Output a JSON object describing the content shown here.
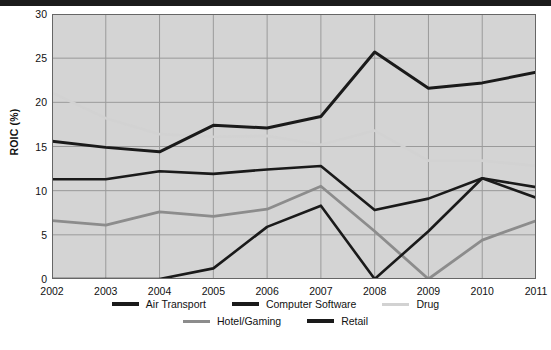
{
  "axis": {
    "ylabel": "ROIC (%)",
    "yticks": [
      0,
      5,
      10,
      15,
      20,
      25,
      30
    ],
    "xticks": [
      "2002",
      "2003",
      "2004",
      "2005",
      "2006",
      "2007",
      "2008",
      "2009",
      "2010",
      "2011"
    ]
  },
  "colors": {
    "air_transport": "#1a1a1a",
    "computer_software": "#1a1a1a",
    "drug": "#d2d2d2",
    "hotel_gaming": "#8c8c8c",
    "retail": "#1a1a1a",
    "plot_background": "#d4d4d4",
    "gridline": "#9a9a9a",
    "axis": "#666666"
  },
  "chart_data": {
    "type": "line",
    "title": "",
    "xlabel": "",
    "ylabel": "ROIC (%)",
    "x": [
      "2002",
      "2003",
      "2004",
      "2005",
      "2006",
      "2007",
      "2008",
      "2009",
      "2010",
      "2011"
    ],
    "ylim": [
      0,
      30
    ],
    "yticks": [
      0,
      5,
      10,
      15,
      20,
      25,
      30
    ],
    "grid": true,
    "legend_position": "bottom",
    "series": [
      {
        "name": "Air Transport",
        "color": "#1a1a1a",
        "width": 2.6,
        "values": [
          11.3,
          11.3,
          12.2,
          11.9,
          12.4,
          12.8,
          7.8,
          9.1,
          11.4,
          9.2
        ]
      },
      {
        "name": "Computer Software",
        "color": "#1a1a1a",
        "width": 3.0,
        "values": [
          15.6,
          14.9,
          14.4,
          17.4,
          17.1,
          18.4,
          25.7,
          21.6,
          22.2,
          23.4
        ]
      },
      {
        "name": "Drug",
        "color": "#d2d2d2",
        "width": 2.6,
        "values": [
          21.1,
          18.2,
          16.4,
          16.1,
          16.2,
          15.2,
          16.8,
          13.4,
          13.4,
          12.8
        ]
      },
      {
        "name": "Hotel/Gaming",
        "color": "#8c8c8c",
        "width": 2.8,
        "values": [
          6.6,
          6.1,
          7.6,
          7.1,
          7.9,
          10.5,
          5.4,
          0.0,
          4.4,
          6.6
        ]
      },
      {
        "name": "Retail",
        "color": "#1a1a1a",
        "width": 2.6,
        "values": [
          0.0,
          0.0,
          0.0,
          1.2,
          5.9,
          8.3,
          0.0,
          5.4,
          11.4,
          10.4
        ]
      }
    ]
  },
  "legend": {
    "row1": [
      {
        "label": "Air Transport",
        "color": "#1a1a1a",
        "thickness": 4
      },
      {
        "label": "Computer Software",
        "color": "#1a1a1a",
        "thickness": 4
      },
      {
        "label": "Drug",
        "color": "#d2d2d2",
        "thickness": 3
      }
    ],
    "row2": [
      {
        "label": "Hotel/Gaming",
        "color": "#8c8c8c",
        "thickness": 3
      },
      {
        "label": "Retail",
        "color": "#1a1a1a",
        "thickness": 4
      }
    ]
  }
}
